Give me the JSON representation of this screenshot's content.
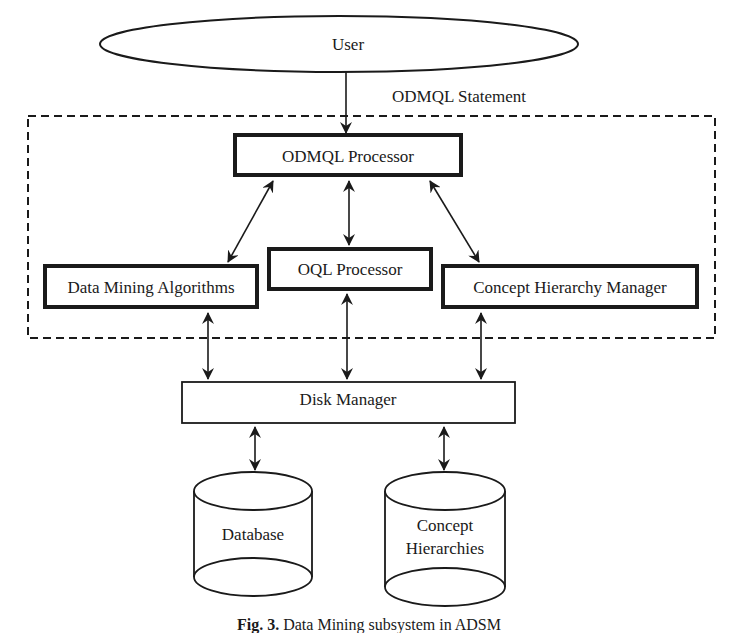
{
  "diagram": {
    "nodes": {
      "user": {
        "label": "User",
        "shape": "ellipse"
      },
      "odmql_processor": {
        "label": "ODMQL Processor",
        "shape": "thick-box"
      },
      "oql_processor": {
        "label": "OQL Processor",
        "shape": "thick-box"
      },
      "data_mining_algorithms": {
        "label": "Data Mining Algorithms",
        "shape": "thick-box"
      },
      "concept_hierarchy_manager": {
        "label": "Concept Hierarchy Manager",
        "shape": "thick-box"
      },
      "disk_manager": {
        "label": "Disk Manager",
        "shape": "box"
      },
      "database": {
        "label": "Database",
        "shape": "cylinder"
      },
      "concept_hierarchies": {
        "label_line1": "Concept",
        "label_line2": "Hierarchies",
        "shape": "cylinder"
      }
    },
    "edges": [
      {
        "from": "user",
        "to": "odmql_processor",
        "label": "ODMQL Statement",
        "direction": "forward"
      },
      {
        "from": "odmql_processor",
        "to": "data_mining_algorithms",
        "direction": "both"
      },
      {
        "from": "odmql_processor",
        "to": "oql_processor",
        "direction": "both"
      },
      {
        "from": "odmql_processor",
        "to": "concept_hierarchy_manager",
        "direction": "both"
      },
      {
        "from": "data_mining_algorithms",
        "to": "disk_manager",
        "direction": "both"
      },
      {
        "from": "oql_processor",
        "to": "disk_manager",
        "direction": "both"
      },
      {
        "from": "concept_hierarchy_manager",
        "to": "disk_manager",
        "direction": "both"
      },
      {
        "from": "disk_manager",
        "to": "database",
        "direction": "both"
      },
      {
        "from": "disk_manager",
        "to": "concept_hierarchies",
        "direction": "both"
      }
    ],
    "edge_label": "ODMQL Statement",
    "group": {
      "style": "dashed",
      "contains": [
        "odmql_processor",
        "oql_processor",
        "data_mining_algorithms",
        "concept_hierarchy_manager"
      ]
    },
    "caption": {
      "fig": "Fig. 3.",
      "text": "Data Mining subsystem in ADSM"
    }
  }
}
